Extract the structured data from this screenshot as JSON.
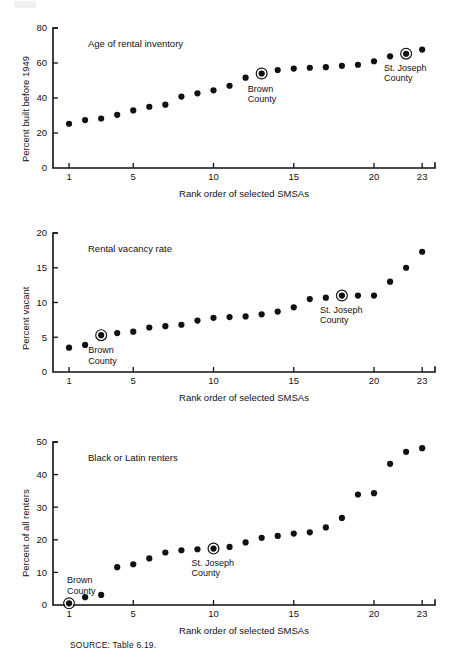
{
  "figure": {
    "source_note": "SOURCE: Table 6.19.",
    "shared_xlabel": "Rank order of selected SMSAs"
  },
  "chart_data": [
    {
      "type": "scatter",
      "title": "Age of rental inventory",
      "xlabel": "Rank order of selected SMSAs",
      "ylabel": "Percent built before 1949",
      "xlim": [
        0,
        23.8
      ],
      "ylim": [
        0,
        80
      ],
      "ytick_values": [
        0,
        20,
        40,
        60,
        80
      ],
      "ytick_labels": [
        "0",
        "20",
        "40",
        "60",
        "80"
      ],
      "xtick_values": [
        1,
        5,
        10,
        15,
        20,
        23
      ],
      "xtick_labels": [
        "1",
        "5",
        "10",
        "15",
        "20",
        "23"
      ],
      "grid": false,
      "legend": "none",
      "x": [
        1,
        2,
        3,
        4,
        5,
        6,
        7,
        8,
        9,
        10,
        11,
        12,
        13,
        14,
        15,
        16,
        17,
        18,
        19,
        20,
        21,
        22,
        23
      ],
      "values": [
        25.3,
        27.4,
        28.3,
        30.4,
        32.9,
        35.0,
        36.2,
        40.8,
        42.7,
        44.4,
        47.0,
        51.6,
        54.0,
        56.0,
        56.8,
        57.3,
        57.6,
        58.4,
        59.0,
        61.0,
        63.8,
        65.3,
        67.7
      ],
      "annotations": [
        {
          "label": "Brown\nCounty",
          "x": 13,
          "y": 54.0,
          "highlight": "circled"
        },
        {
          "label": "St. Joseph\nCounty",
          "x": 22,
          "y": 65.3,
          "highlight": "circled"
        }
      ]
    },
    {
      "type": "scatter",
      "title": "Rental vacancy rate",
      "xlabel": "Rank order of selected SMSAs",
      "ylabel": "Percent vacant",
      "xlim": [
        0,
        23.8
      ],
      "ylim": [
        0,
        20
      ],
      "ytick_values": [
        0,
        5,
        10,
        15,
        20
      ],
      "ytick_labels": [
        "0",
        "5",
        "10",
        "15",
        "20"
      ],
      "xtick_values": [
        1,
        5,
        10,
        15,
        20,
        23
      ],
      "xtick_labels": [
        "1",
        "5",
        "10",
        "15",
        "20",
        "23"
      ],
      "grid": false,
      "legend": "none",
      "x": [
        1,
        2,
        3,
        4,
        5,
        6,
        7,
        8,
        9,
        10,
        11,
        12,
        13,
        14,
        15,
        16,
        17,
        18,
        19,
        20,
        21,
        22,
        23
      ],
      "values": [
        3.5,
        3.9,
        5.3,
        5.6,
        5.8,
        6.4,
        6.6,
        6.8,
        7.4,
        7.8,
        7.9,
        8.0,
        8.3,
        8.7,
        9.3,
        10.5,
        10.7,
        11.0,
        11.0,
        11.0,
        13.0,
        15.0,
        17.3
      ],
      "annotations": [
        {
          "label": "Brown\nCounty",
          "x": 3,
          "y": 5.3,
          "highlight": "circled"
        },
        {
          "label": "St. Joseph\nCounty",
          "x": 18,
          "y": 11.0,
          "highlight": "circled"
        }
      ]
    },
    {
      "type": "scatter",
      "title": "Black or Latin renters",
      "xlabel": "Rank order of selected SMSAs",
      "ylabel": "Percent of all renters",
      "xlim": [
        0,
        23.8
      ],
      "ylim": [
        0,
        50
      ],
      "ytick_values": [
        0,
        10,
        20,
        30,
        40,
        50
      ],
      "ytick_labels": [
        "0",
        "10",
        "20",
        "30",
        "40",
        "50"
      ],
      "xtick_values": [
        1,
        5,
        10,
        15,
        20,
        23
      ],
      "xtick_labels": [
        "1",
        "5",
        "10",
        "15",
        "20",
        "23"
      ],
      "grid": false,
      "legend": "none",
      "x": [
        1,
        2,
        3,
        4,
        5,
        6,
        7,
        8,
        9,
        10,
        11,
        12,
        13,
        14,
        15,
        16,
        17,
        18,
        19,
        20,
        21,
        22,
        23
      ],
      "values": [
        0.5,
        2.4,
        3.1,
        11.6,
        12.5,
        14.3,
        16.1,
        16.8,
        17.1,
        17.3,
        17.8,
        19.2,
        20.6,
        21.2,
        21.9,
        22.3,
        23.8,
        26.7,
        33.9,
        34.3,
        43.3,
        47.0,
        48.1
      ],
      "annotations": [
        {
          "label": "Brown\nCounty",
          "x": 1,
          "y": 0.5,
          "highlight": "circled"
        },
        {
          "label": "St. Joseph\nCounty",
          "x": 10,
          "y": 17.3,
          "highlight": "circled"
        }
      ]
    }
  ]
}
